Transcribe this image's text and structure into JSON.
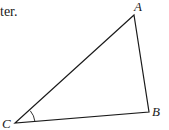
{
  "caption": "ter.",
  "diagram": {
    "type": "triangle",
    "vertices": {
      "A": {
        "label": "A",
        "x": 134,
        "y": 15
      },
      "B": {
        "label": "B",
        "x": 149,
        "y": 112
      },
      "C": {
        "label": "C",
        "x": 15,
        "y": 123
      }
    },
    "marked_angle": "C",
    "stroke_color": "#1a1a1a"
  }
}
